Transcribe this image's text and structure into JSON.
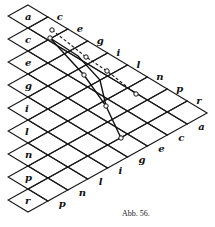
{
  "figure": {
    "caption": "Abb. 56.",
    "grid": {
      "origin": [
        28,
        5
      ],
      "R": [
        19.9,
        12
      ],
      "L": [
        -19.9,
        11
      ],
      "size": 9
    },
    "left_column_labels": [
      "a",
      "c",
      "e",
      "g",
      "i",
      "l",
      "n",
      "p",
      "r"
    ],
    "top_edge_labels": [
      "c",
      "e",
      "g",
      "i",
      "l",
      "n",
      "p",
      "r"
    ],
    "bottom_edge_labels": [
      "p",
      "n",
      "l",
      "i",
      "g",
      "e",
      "c",
      "a"
    ],
    "dashed_line": {
      "points": [
        [
          52,
          30
        ],
        [
          86,
          57
        ],
        [
          107,
          71
        ],
        [
          136,
          94
        ]
      ]
    },
    "solid_curves": [
      {
        "points": [
          [
            50,
            38
          ],
          [
            84,
            75
          ],
          [
            106,
            106
          ],
          [
            121,
            138
          ]
        ]
      },
      {
        "points": [
          [
            50,
            38
          ],
          [
            78,
            56
          ],
          [
            100,
            80
          ],
          [
            106,
            106
          ]
        ]
      }
    ],
    "markers": [
      [
        52,
        30
      ],
      [
        86,
        57
      ],
      [
        107,
        71
      ],
      [
        136,
        94
      ],
      [
        50,
        38
      ],
      [
        84,
        75
      ],
      [
        106,
        106
      ],
      [
        121,
        138
      ]
    ]
  }
}
